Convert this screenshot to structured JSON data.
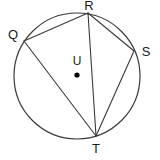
{
  "figure": {
    "type": "circle-geometry-diagram",
    "background_color": "#ffffff",
    "stroke_color": "#3a3a3a",
    "label_color": "#1a1a1a",
    "dot_color": "#000000"
  },
  "circle": {
    "name": "circle-U",
    "center_x": 77,
    "center_y": 76,
    "radius": 63,
    "stroke_width": 1.2
  },
  "center_point": {
    "label": "U",
    "label_x": 77,
    "label_y": 62,
    "dot_x": 77,
    "dot_y": 75,
    "dot_radius": 2.6
  },
  "vertices": [
    {
      "label": "Q",
      "x": 24,
      "y": 41,
      "label_x": 13,
      "label_y": 36
    },
    {
      "label": "R",
      "x": 88,
      "y": 13,
      "label_x": 89,
      "label_y": 7
    },
    {
      "label": "S",
      "x": 134,
      "y": 51,
      "label_x": 146,
      "label_y": 53
    },
    {
      "label": "T",
      "x": 96,
      "y": 136,
      "label_x": 96,
      "label_y": 150
    }
  ],
  "chords": [
    {
      "name": "chord-QR",
      "from": "Q",
      "to": "R",
      "x1": 24,
      "y1": 41,
      "x2": 88,
      "y2": 13
    },
    {
      "name": "chord-RS",
      "from": "R",
      "to": "S",
      "x1": 88,
      "y1": 13,
      "x2": 134,
      "y2": 51
    },
    {
      "name": "chord-ST",
      "from": "S",
      "to": "T",
      "x1": 134,
      "y1": 51,
      "x2": 96,
      "y2": 136
    },
    {
      "name": "chord-QT",
      "from": "Q",
      "to": "T",
      "x1": 24,
      "y1": 41,
      "x2": 96,
      "y2": 136
    },
    {
      "name": "chord-RT",
      "from": "R",
      "to": "T",
      "x1": 88,
      "y1": 13,
      "x2": 96,
      "y2": 136
    }
  ]
}
